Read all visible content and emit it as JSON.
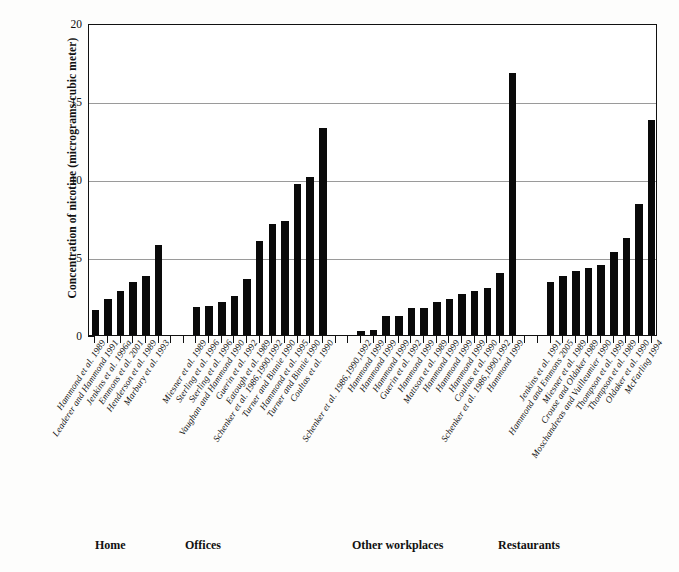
{
  "chart_data": {
    "type": "bar",
    "title": "",
    "xlabel": "",
    "ylabel": "Concentration of nicotine (micrograms/cubic meter)",
    "ylim": [
      0,
      20
    ],
    "yticks": [
      0,
      5,
      10,
      15,
      20
    ],
    "ytick_labels": [
      "0",
      "5",
      "10",
      "15",
      "20"
    ],
    "minor_tick_step": 1,
    "grid": "horizontal",
    "legend": "none",
    "bar_color": "#0a0a0a",
    "groups": [
      {
        "name": "Home",
        "categories": [
          "Hammond et al. 1989",
          "Leaderer and Hammond 1991",
          "Jenkins et al. 1996a",
          "Emmons et al. 2001",
          "Henderson et al. 1989",
          "Marbury et al. 1993"
        ],
        "values": [
          1.6,
          2.3,
          2.8,
          3.4,
          3.8,
          5.8
        ]
      },
      {
        "name": "Offices",
        "categories": [
          "Miesner et al. 1989",
          "Sterling et al. 1996",
          "Sterling et al. 1996",
          "Vaughan and Hammond 1990",
          "Guerin et al. 1992",
          "Eatough et al. 1989",
          "Schenker et al. 1986,1990,1992",
          "Turner and Binnie 1990",
          "Hammond et al. 1995",
          "Turner and Binnie 1990",
          "Coultas et al. 1990"
        ],
        "values": [
          1.8,
          1.85,
          2.1,
          2.5,
          3.6,
          6.0,
          7.1,
          7.3,
          9.7,
          10.1,
          13.3
        ]
      },
      {
        "name": "Other workplaces",
        "categories": [
          "Schenker et al. 1986,1990,1992",
          "Hammond 1999",
          "Hammond 1999",
          "Hammond 1999",
          "Guerin et al. 1992",
          "Hammond 1999",
          "Mattson et al. 1989",
          "Hammond 1999",
          "Hammond 1999",
          "Hammond 1999",
          "Coultas et al. 1990"
        ],
        "values": [
          0.25,
          0.35,
          1.2,
          1.25,
          1.7,
          1.75,
          2.1,
          2.3,
          2.6,
          2.8,
          3.0,
          4.0,
          16.8
        ]
      },
      {
        "name": "Restaurants",
        "categories": [
          "Jenkins et al. 1991",
          "Hammond and Emmons 2005",
          "Miesner et al. 1989",
          "Crouse and Oldaker 1989",
          "Moschandreas and Vuilleumier 1990",
          "Thompson et al. 1999",
          "Thompson et al. 1989",
          "Oldaker et al. 1990",
          "McFarling 1994"
        ],
        "values": [
          3.4,
          3.8,
          4.1,
          4.3,
          4.5,
          5.3,
          6.2,
          8.4,
          13.8
        ]
      }
    ]
  }
}
